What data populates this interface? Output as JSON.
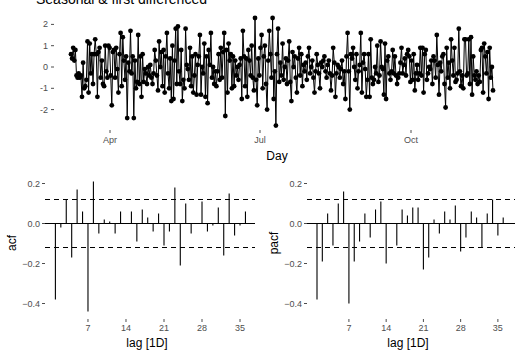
{
  "title": "Seasonal & first differenced",
  "chart_data": [
    {
      "type": "line",
      "title": "Seasonal & first differenced",
      "xlabel": "Day",
      "ylabel": "",
      "x_ticks": [
        "Apr",
        "Jul",
        "Oct"
      ],
      "y_ticks": [
        2,
        1,
        0,
        -1,
        -2
      ],
      "ylim": [
        -2.8,
        2.5
      ],
      "markers": true,
      "grid": false,
      "values": [
        0.6,
        0.4,
        0.9,
        0.3,
        0.8,
        -0.4,
        -0.5,
        -0.3,
        -0.5,
        -0.4,
        -1.4,
        0.2,
        -1.0,
        -0.9,
        -0.6,
        1.2,
        -1.2,
        1.1,
        -0.3,
        0.6,
        -0.8,
        0.6,
        1.3,
        0.6,
        -1.4,
        0.7,
        0.9,
        -0.5,
        0.3,
        -0.8,
        -0.9,
        1.0,
        -0.2,
        -0.5,
        1.0,
        0.9,
        -0.4,
        -1.8,
        0.7,
        0.8,
        -0.5,
        0.9,
        -0.1,
        -1.2,
        0.6,
        1.6,
        -0.9,
        1.4,
        0.3,
        -0.6,
        0.5,
        -2.4,
        0.2,
        -0.2,
        1.7,
        -0.3,
        0.5,
        -2.4,
        0.3,
        -1.0,
        -0.7,
        1.5,
        -0.8,
        0.5,
        -1.4,
        0.6,
        -0.7,
        -0.1,
        -0.3,
        -0.8,
        0.0,
        -0.4,
        0.1,
        -0.5,
        -0.8,
        -0.3,
        0.8,
        0.3,
        -0.4,
        -1.1,
        1.2,
        0.0,
        0.7,
        -0.9,
        0.8,
        -1.2,
        0.5,
        1.6,
        -0.3,
        -1.0,
        0.4,
        -1.6,
        1.0,
        -1.5,
        0.3,
        1.8,
        -0.8,
        1.9,
        -0.2,
        -0.8,
        0.8,
        -1.6,
        -0.6,
        -1.0,
        1.8,
        0.1,
        -0.1,
        -0.6,
        0.9,
        -0.9,
        0.5,
        -1.2,
        -0.4,
        0.6,
        -1.3,
        0.1,
        0.5,
        1.5,
        -1.3,
        0.0,
        -0.3,
        1.1,
        -1.4,
        0.5,
        -1.7,
        0.8,
        0.1,
        1.6,
        -0.5,
        0.0,
        -0.8,
        -0.2,
        -0.9,
        -0.2,
        0.6,
        -0.6,
        0.9,
        -0.5,
        0.7,
        1.6,
        -2.3,
        0.8,
        -1.2,
        1.1,
        0.3,
        0.6,
        -1.0,
        0.5,
        -0.9,
        0.3,
        -0.4,
        0.0,
        -0.6,
        0.1,
        0.4,
        -1.5,
        1.7,
        0.5,
        -0.9,
        0.4,
        -1.4,
        0.8,
        0.3,
        -0.4,
        1.0,
        -0.5,
        -1.1,
        2.3,
        -0.6,
        -1.8,
        0.4,
        -0.4,
        0.9,
        1.5,
        -1.0,
        0.5,
        1.0,
        -0.8,
        -2.0,
        0.3,
        1.7,
        0.6,
        -0.5,
        2.3,
        -1.5,
        -0.2,
        -2.75,
        0.6,
        1.8,
        -0.7,
        0.2,
        -0.4,
        1.1,
        -0.6,
        0.0,
        0.4,
        -0.8,
        0.3,
        1.2,
        -0.7,
        -1.6,
        0.7,
        0.0,
        0.5,
        -0.5,
        -1.2,
        0.4,
        0.9,
        -0.4,
        0.6,
        -0.9,
        0.1,
        -0.2,
        0.2,
        -0.6,
        0.5,
        0.9,
        -0.3,
        0.0,
        0.3,
        -0.5,
        -1.2,
        -0.2,
        0.6,
        0.1,
        -0.3,
        -1.0,
        0.2,
        0.0,
        0.3,
        0.5,
        -0.2,
        -0.5,
        0.1,
        0.3,
        -0.3,
        -1.1,
        -0.4,
        0.9,
        0.2,
        -1.4,
        -0.3,
        0.1,
        0.0,
        -0.5,
        -0.1,
        0.3,
        -0.8,
        -0.2,
        -1.5,
        0.5,
        1.6,
        -0.2,
        -2.0,
        0.6,
        0.4,
        0.9,
        0.0,
        -0.6,
        0.6,
        -1.0,
        -0.2,
        0.1,
        1.6,
        -1.2,
        0.2,
        0.6,
        -0.1,
        -1.4,
        -0.6,
        0.6,
        -1.4,
        1.3,
        -0.5,
        -0.8,
        -0.6,
        0.0,
        -0.3,
        1.0,
        -0.7,
        -0.4,
        1.2,
        0.0,
        -0.1,
        -1.3,
        1.1,
        -1.5,
        0.3,
        0.5,
        -0.3,
        -0.6,
        -0.2,
        0.8,
        -0.3,
        0.5,
        -0.4,
        -0.8,
        -0.5,
        -0.3,
        0.2,
        0.9,
        -0.3,
        0.1,
        0.4,
        -0.4,
        0.6,
        0.8,
        0.5,
        -0.7,
        0.3,
        -0.6,
        0.6,
        -1.1,
        -0.3,
        0.1,
        -0.6,
        -0.3,
        0.9,
        -0.4,
        0.9,
        -1.2,
        0.6,
        0.8,
        -0.6,
        -0.3,
        0.0,
        -0.1,
        0.3,
        -0.8,
        0.5,
        0.3,
        -0.5,
        1.5,
        0.1,
        -1.3,
        0.2,
        -0.2,
        0.5,
        0.6,
        -0.8,
        -1.9,
        0.9,
        -0.5,
        0.2,
        -1.0,
        1.3,
        0.3,
        -0.4,
        0.9,
        -0.7,
        -0.6,
        -0.3,
        1.8,
        -0.2,
        -0.9,
        -0.4,
        -1.0,
        1.3,
        1.3,
        -0.4,
        -0.3,
        1.3,
        -0.8,
        1.4,
        -1.3,
        0.5,
        -0.4,
        -0.6,
        -0.2,
        -0.8,
        -0.4,
        -0.7,
        0.8,
        0.9,
        -1.2,
        1.1,
        0.5,
        -0.3,
        0.7,
        -1.5,
        0.9,
        -0.5,
        0.0,
        -1.1
      ]
    },
    {
      "type": "bar",
      "title": "",
      "xlabel": "lag [1D]",
      "ylabel": "acf",
      "categories": [
        1,
        2,
        3,
        4,
        5,
        6,
        7,
        8,
        9,
        10,
        11,
        12,
        13,
        14,
        15,
        16,
        17,
        18,
        19,
        20,
        21,
        22,
        23,
        24,
        25,
        26,
        27,
        28,
        29,
        30,
        31,
        32,
        33,
        34,
        35,
        36
      ],
      "values": [
        -0.38,
        -0.02,
        0.12,
        -0.17,
        0.17,
        0.06,
        -0.44,
        0.21,
        -0.05,
        0.02,
        0.01,
        -0.05,
        0.06,
        0.0,
        0.06,
        -0.09,
        0.07,
        0.03,
        -0.04,
        0.05,
        -0.11,
        -0.04,
        0.18,
        -0.21,
        0.1,
        -0.05,
        0.0,
        0.11,
        -0.04,
        -0.01,
        0.08,
        -0.16,
        0.15,
        -0.06,
        -0.01,
        0.06
      ],
      "x_ticks": [
        7,
        14,
        21,
        28,
        35
      ],
      "y_ticks": [
        "0.2",
        "0.0",
        "-0.2",
        "-0.4"
      ],
      "ylim": [
        -0.45,
        0.22
      ],
      "confidence_bounds": [
        -0.12,
        0.12
      ]
    },
    {
      "type": "bar",
      "title": "",
      "xlabel": "lag [1D]",
      "ylabel": "pacf",
      "categories": [
        1,
        2,
        3,
        4,
        5,
        6,
        7,
        8,
        9,
        10,
        11,
        12,
        13,
        14,
        15,
        16,
        17,
        18,
        19,
        20,
        21,
        22,
        23,
        24,
        25,
        26,
        27,
        28,
        29,
        30,
        31,
        32,
        33,
        34,
        35,
        36
      ],
      "values": [
        -0.38,
        -0.19,
        0.05,
        -0.11,
        0.1,
        0.16,
        -0.4,
        -0.19,
        -0.09,
        0.05,
        -0.07,
        0.07,
        0.11,
        -0.2,
        0.0,
        -0.11,
        0.07,
        0.04,
        0.08,
        0.08,
        -0.23,
        -0.17,
        0.02,
        -0.05,
        0.06,
        0.02,
        0.09,
        -0.14,
        -0.07,
        0.06,
        0.03,
        -0.12,
        0.05,
        0.12,
        -0.06,
        0.03
      ],
      "x_ticks": [
        7,
        14,
        21,
        28,
        35
      ],
      "y_ticks": [
        "0.2",
        "0.0",
        "-0.2",
        "-0.4"
      ],
      "ylim": [
        -0.45,
        0.22
      ],
      "confidence_bounds": [
        -0.12,
        0.12
      ]
    }
  ]
}
